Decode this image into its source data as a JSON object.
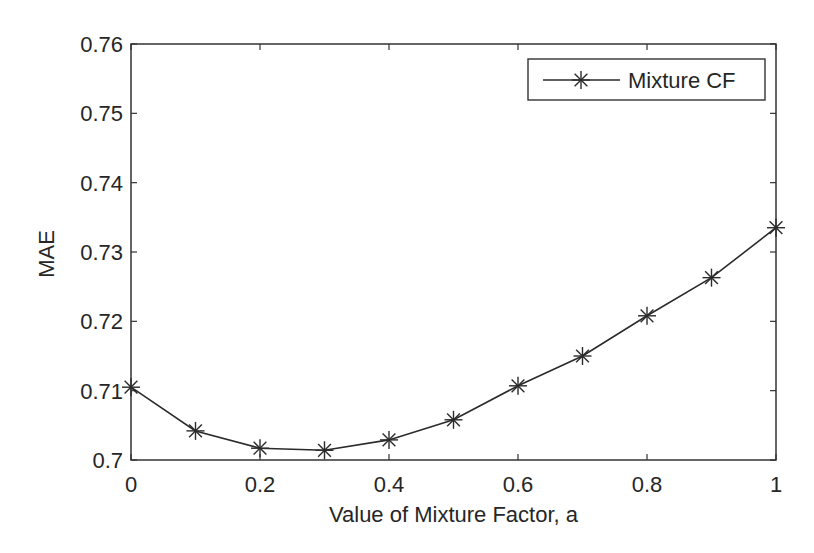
{
  "chart_data": {
    "type": "line",
    "title": "",
    "xlabel": "Value of Mixture Factor, a",
    "ylabel": "MAE",
    "xlim": [
      0,
      1
    ],
    "ylim": [
      0.7,
      0.76
    ],
    "xticks": [
      0,
      0.2,
      0.4,
      0.6,
      0.8,
      1
    ],
    "xtick_labels": [
      "0",
      "0.2",
      "0.4",
      "0.6",
      "0.8",
      "1"
    ],
    "yticks": [
      0.7,
      0.71,
      0.72,
      0.73,
      0.74,
      0.75,
      0.76
    ],
    "ytick_labels": [
      "0.7",
      "0.71",
      "0.72",
      "0.73",
      "0.74",
      "0.75",
      "0.76"
    ],
    "grid": false,
    "legend_position": "upper right",
    "x": [
      0,
      0.1,
      0.2,
      0.3,
      0.4,
      0.5,
      0.6,
      0.7,
      0.8,
      0.9,
      1.0
    ],
    "series": [
      {
        "name": "Mixture CF",
        "marker": "asterisk",
        "color": "#2b2b2b",
        "values": [
          0.7105,
          0.7042,
          0.7017,
          0.7014,
          0.7029,
          0.7058,
          0.7107,
          0.715,
          0.7208,
          0.7263,
          0.7335
        ]
      }
    ]
  },
  "legend": {
    "entries": [
      "Mixture CF"
    ]
  },
  "colors": {
    "axis": "#333333",
    "line": "#2b2b2b",
    "text": "#262626",
    "background": "#ffffff"
  }
}
